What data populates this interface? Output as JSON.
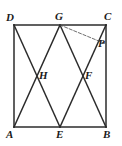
{
  "figure": {
    "type": "geometry-diagram",
    "stroke_color": "#2b2b2b",
    "dash_color": "#4a4a4a",
    "background_color": "#ffffff",
    "caption": "",
    "labels": [
      {
        "id": "D",
        "text": "D",
        "x": 6,
        "y": 12
      },
      {
        "id": "G",
        "text": "G",
        "x": 55,
        "y": 11
      },
      {
        "id": "C",
        "text": "C",
        "x": 104,
        "y": 11
      },
      {
        "id": "P",
        "text": "P",
        "x": 98,
        "y": 38
      },
      {
        "id": "H",
        "text": "H",
        "x": 39,
        "y": 70
      },
      {
        "id": "F",
        "text": "F",
        "x": 85,
        "y": 70
      },
      {
        "id": "A",
        "text": "A",
        "x": 6,
        "y": 129
      },
      {
        "id": "E",
        "text": "E",
        "x": 56,
        "y": 129
      },
      {
        "id": "B",
        "text": "B",
        "x": 103,
        "y": 129
      }
    ],
    "points": {
      "A": {
        "x": 14,
        "y": 127
      },
      "B": {
        "x": 106,
        "y": 127
      },
      "C": {
        "x": 106,
        "y": 25
      },
      "D": {
        "x": 14,
        "y": 25
      },
      "E": {
        "x": 60,
        "y": 127
      },
      "G": {
        "x": 60,
        "y": 25
      },
      "H": {
        "x": 37,
        "y": 76
      },
      "F": {
        "x": 83,
        "y": 76
      },
      "P": {
        "x": 106,
        "y": 44
      }
    },
    "segments": [
      {
        "id": "side-DC",
        "from": "D",
        "to": "C",
        "style": "solid"
      },
      {
        "id": "side-AB",
        "from": "A",
        "to": "B",
        "style": "solid"
      },
      {
        "id": "side-AD",
        "from": "A",
        "to": "D",
        "style": "solid"
      },
      {
        "id": "side-BC",
        "from": "B",
        "to": "C",
        "style": "solid"
      },
      {
        "id": "diagonal-D-E",
        "from": "D",
        "to": "E",
        "style": "solid"
      },
      {
        "id": "diagonal-G-A",
        "from": "G",
        "to": "A",
        "style": "solid"
      },
      {
        "id": "diagonal-G-B",
        "from": "G",
        "to": "B",
        "style": "solid"
      },
      {
        "id": "diagonal-E-C",
        "from": "E",
        "to": "C",
        "style": "solid"
      },
      {
        "id": "dashed-G-P",
        "from": "G",
        "to": "P",
        "style": "dashed"
      }
    ]
  }
}
